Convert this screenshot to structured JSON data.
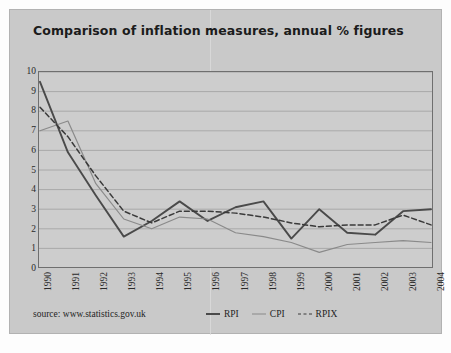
{
  "title": "Comparison of inflation measures, annual % figures",
  "source": "source: www.statistics.gov.uk",
  "legend": {
    "rpi": "RPI",
    "cpi": "CPI",
    "rpix": "RPIX"
  },
  "colors": {
    "card_background": "#c9c9c9",
    "plot_background": "#cdcdcd",
    "plot_border": "#6f6f6f",
    "gridline": "#9a9a9a",
    "rpi_line": "#4a4a4a",
    "cpi_line": "#8a8a8a",
    "rpix_line": "#3a3a3a",
    "text": "#242424"
  },
  "chart_data": {
    "type": "line",
    "title": "Comparison of inflation measures, annual % figures",
    "xlabel": "",
    "ylabel": "",
    "categories": [
      "1990",
      "1991",
      "1992",
      "1993",
      "1994",
      "1995",
      "1996",
      "1997",
      "1998",
      "1999",
      "2000",
      "2001",
      "2002",
      "2003",
      "2004"
    ],
    "x": [
      1990,
      1991,
      1992,
      1993,
      1994,
      1995,
      1996,
      1997,
      1998,
      1999,
      2000,
      2001,
      2002,
      2003,
      2004
    ],
    "ylim": [
      0,
      10
    ],
    "yticks": [
      0,
      1,
      2,
      3,
      4,
      5,
      6,
      7,
      8,
      9,
      10
    ],
    "grid": true,
    "legend_position": "bottom",
    "series": [
      {
        "name": "RPI",
        "style": "solid-thick",
        "color": "#4a4a4a",
        "values": [
          9.5,
          5.9,
          3.7,
          1.6,
          2.4,
          3.4,
          2.4,
          3.1,
          3.4,
          1.5,
          3.0,
          1.8,
          1.7,
          2.9,
          3.0
        ]
      },
      {
        "name": "CPI",
        "style": "solid-thin",
        "color": "#8a8a8a",
        "values": [
          7.0,
          7.5,
          4.3,
          2.5,
          2.0,
          2.6,
          2.5,
          1.8,
          1.6,
          1.3,
          0.8,
          1.2,
          1.3,
          1.4,
          1.3
        ]
      },
      {
        "name": "RPIX",
        "style": "dashed",
        "color": "#3a3a3a",
        "values": [
          8.2,
          6.7,
          4.7,
          2.9,
          2.3,
          2.9,
          2.9,
          2.8,
          2.6,
          2.3,
          2.1,
          2.2,
          2.2,
          2.7,
          2.2
        ]
      }
    ]
  }
}
